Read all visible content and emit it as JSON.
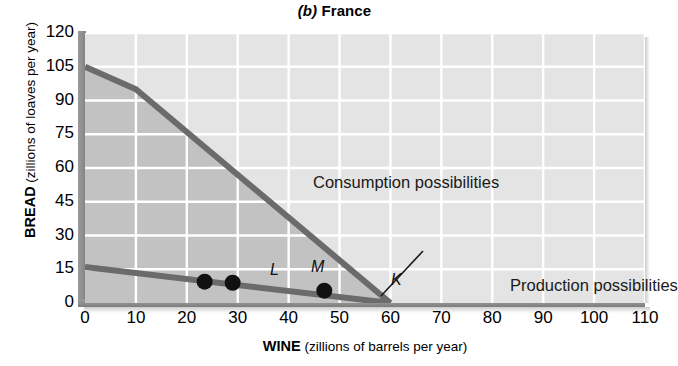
{
  "title": {
    "panel": "(b)",
    "name": "France",
    "full": "(b) France"
  },
  "axes": {
    "y": {
      "label_bold": "BREAD",
      "label_rest": "(zillions of loaves per year)",
      "ticks": [
        "0",
        "15",
        "30",
        "45",
        "60",
        "75",
        "90",
        "105",
        "120"
      ],
      "min": 0,
      "max": 120,
      "step": 15
    },
    "x": {
      "label_bold": "WINE",
      "label_rest": "(zillions of barrels per year)",
      "ticks": [
        "0",
        "10",
        "20",
        "30",
        "40",
        "50",
        "60",
        "70",
        "80",
        "90",
        "100",
        "110"
      ],
      "min": 0,
      "max": 110,
      "step": 10
    }
  },
  "annotations": {
    "consumption": "Consumption possibilities",
    "production": "Production possibilities",
    "points": [
      {
        "name": "L",
        "x": 23.5,
        "y": 9.5
      },
      {
        "name": "M",
        "x": 29,
        "y": 9.0
      },
      {
        "name": "K",
        "x": 47,
        "y": 5.5
      }
    ]
  },
  "colors": {
    "plot_background": "#e4e4e4",
    "shaded_region": "#c2c2c2",
    "gridline": "#ffffff",
    "line": "#6b6b6b",
    "axis_rail": "#8d8d8d",
    "point": "#111111",
    "text": "#000000"
  },
  "chart_data": {
    "type": "line",
    "title": "(b) France",
    "xlabel": "WINE (zillions of barrels per year)",
    "ylabel": "BREAD (zillions of loaves per year)",
    "xlim": [
      0,
      110
    ],
    "ylim": [
      0,
      120
    ],
    "grid": true,
    "legend": "in-plot labels",
    "series": [
      {
        "name": "Consumption possibilities",
        "type": "line",
        "x": [
          0,
          10,
          60
        ],
        "y": [
          105,
          95,
          0
        ],
        "color": "#6b6b6b"
      },
      {
        "name": "Production possibilities",
        "type": "line",
        "x": [
          0,
          60
        ],
        "y": [
          16,
          0
        ],
        "color": "#6b6b6b"
      }
    ],
    "shaded_region": {
      "label": "Consumption possibilities set",
      "vertices": [
        [
          0,
          0
        ],
        [
          0,
          105
        ],
        [
          10,
          95
        ],
        [
          60,
          0
        ]
      ],
      "color": "#c2c2c2"
    },
    "points": [
      {
        "label": "L",
        "x": 23.5,
        "y": 9.5
      },
      {
        "label": "M",
        "x": 29,
        "y": 9.0
      },
      {
        "label": "K",
        "x": 47,
        "y": 5.5
      }
    ]
  }
}
